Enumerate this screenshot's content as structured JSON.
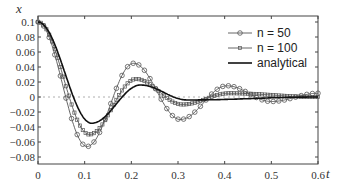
{
  "chart_data": {
    "type": "line",
    "title": "",
    "xlabel": "t",
    "ylabel": "x",
    "xlim": [
      0,
      0.6
    ],
    "ylim": [
      -0.09,
      0.105
    ],
    "x_ticks": [
      "0",
      "0.1",
      "0.2",
      "0.3",
      "0.4",
      "0.5",
      "0.6"
    ],
    "y_ticks": [
      "0.1",
      "0.08",
      "0.06",
      "0.04",
      "0.02",
      "0",
      "-0.02",
      "-0.04",
      "-0.06",
      "-0.08"
    ],
    "grid": false,
    "zero_line": "dashed",
    "legend_position": "upper right",
    "legend": [
      "n = 50",
      "n = 100",
      "analytical"
    ],
    "series": [
      {
        "name": "n = 50",
        "marker": "circle",
        "peaks": [
          {
            "t": 0.0,
            "x": 0.1
          },
          {
            "t": 0.105,
            "x": -0.066
          },
          {
            "t": 0.205,
            "x": 0.045
          },
          {
            "t": 0.305,
            "x": -0.03
          },
          {
            "t": 0.405,
            "x": 0.015
          },
          {
            "t": 0.5,
            "x": -0.006
          },
          {
            "t": 0.6,
            "x": 0.005
          }
        ]
      },
      {
        "name": "n = 100",
        "marker": "square",
        "peaks": [
          {
            "t": 0.0,
            "x": 0.1
          },
          {
            "t": 0.11,
            "x": -0.05
          },
          {
            "t": 0.21,
            "x": 0.024
          },
          {
            "t": 0.31,
            "x": -0.01
          },
          {
            "t": 0.41,
            "x": 0.005
          },
          {
            "t": 0.6,
            "x": 0.0
          }
        ]
      },
      {
        "name": "analytical",
        "marker": "none",
        "peaks": [
          {
            "t": 0.0,
            "x": 0.1
          },
          {
            "t": 0.115,
            "x": -0.035
          },
          {
            "t": 0.22,
            "x": 0.016
          },
          {
            "t": 0.32,
            "x": -0.004
          },
          {
            "t": 0.6,
            "x": 0.0
          }
        ]
      }
    ]
  }
}
